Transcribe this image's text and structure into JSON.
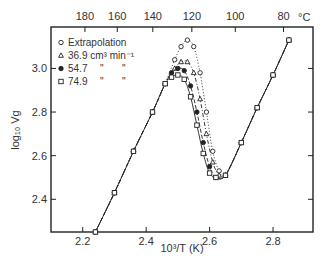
{
  "chart_data": {
    "type": "line",
    "title": "",
    "xlabel": "10³/T (K)",
    "ylabel": "log₁₀ Vg",
    "top_axis_label": "°C",
    "xlim": [
      2.1,
      2.926
    ],
    "ylim": [
      2.25,
      3.19
    ],
    "grid": false,
    "legend_position": "upper-left-inside",
    "x_ticks": [
      2.2,
      2.4,
      2.6,
      2.8
    ],
    "x_tick_labels": [
      "2.2",
      "2.4",
      "2.6",
      "2.8"
    ],
    "y_ticks": [
      2.4,
      2.6,
      2.8,
      3.0
    ],
    "y_tick_labels": [
      "2.4",
      "2.6",
      "2.8",
      "3.0"
    ],
    "top_ticks": [
      {
        "label": "180",
        "x": 2.207
      },
      {
        "label": "160",
        "x": 2.309
      },
      {
        "label": "140",
        "x": 2.421
      },
      {
        "label": "120",
        "x": 2.544
      },
      {
        "label": "100",
        "x": 2.681
      },
      {
        "label": "80",
        "x": 2.833
      }
    ],
    "series": [
      {
        "name": "Extrapolation",
        "marker": "open-circle",
        "line": "dotted",
        "x": [
          2.24,
          2.3,
          2.36,
          2.42,
          2.46,
          2.49,
          2.51,
          2.53,
          2.55,
          2.57,
          2.59,
          2.61,
          2.63,
          2.65,
          2.7,
          2.75,
          2.8,
          2.85
        ],
        "y": [
          2.25,
          2.43,
          2.62,
          2.8,
          2.93,
          3.04,
          3.1,
          3.13,
          3.1,
          2.98,
          2.8,
          2.62,
          2.53,
          2.51,
          2.66,
          2.82,
          2.97,
          3.13
        ]
      },
      {
        "name": "36.9 cm³ min⁻¹",
        "marker": "open-triangle",
        "line": "dash-dot",
        "x": [
          2.24,
          2.3,
          2.36,
          2.42,
          2.46,
          2.49,
          2.51,
          2.53,
          2.55,
          2.57,
          2.59,
          2.61,
          2.63,
          2.65,
          2.7,
          2.75,
          2.8,
          2.85
        ],
        "y": [
          2.25,
          2.43,
          2.62,
          2.8,
          2.93,
          3.0,
          3.03,
          3.03,
          2.98,
          2.86,
          2.7,
          2.57,
          2.51,
          2.51,
          2.66,
          2.82,
          2.97,
          3.13
        ]
      },
      {
        "name": "54.7",
        "marker": "filled-circle",
        "line": "dashed",
        "x": [
          2.24,
          2.3,
          2.36,
          2.42,
          2.46,
          2.48,
          2.5,
          2.52,
          2.54,
          2.56,
          2.58,
          2.6,
          2.62,
          2.65,
          2.7,
          2.75,
          2.8,
          2.85
        ],
        "y": [
          2.25,
          2.43,
          2.62,
          2.8,
          2.93,
          2.98,
          3.0,
          2.99,
          2.92,
          2.8,
          2.66,
          2.55,
          2.5,
          2.51,
          2.66,
          2.82,
          2.97,
          3.13
        ]
      },
      {
        "name": "74.9",
        "marker": "open-square",
        "line": "solid",
        "x": [
          2.24,
          2.3,
          2.36,
          2.42,
          2.46,
          2.48,
          2.5,
          2.52,
          2.54,
          2.56,
          2.58,
          2.6,
          2.62,
          2.65,
          2.7,
          2.75,
          2.8,
          2.85
        ],
        "y": [
          2.25,
          2.43,
          2.62,
          2.8,
          2.93,
          2.96,
          2.97,
          2.95,
          2.87,
          2.74,
          2.61,
          2.52,
          2.5,
          2.51,
          2.66,
          2.82,
          2.97,
          3.13
        ]
      }
    ]
  },
  "legend": {
    "items": [
      {
        "marker": "open-circle",
        "label": "Extrapolation",
        "suffix": ""
      },
      {
        "marker": "open-triangle",
        "label": "36.9 cm³ min⁻¹",
        "suffix": ""
      },
      {
        "marker": "filled-circle",
        "label": "54.7",
        "suffix": "\"      \""
      },
      {
        "marker": "open-square",
        "label": "74.9",
        "suffix": "\"      \""
      }
    ]
  },
  "colors": {
    "ink": "#222222",
    "background": "#ffffff"
  }
}
